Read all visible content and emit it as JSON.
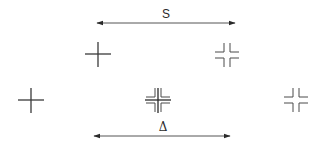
{
  "diagram": {
    "type": "shear-interferometry-pattern",
    "colors": {
      "stroke": "#3a3a3a",
      "background": "#ffffff"
    },
    "arrows": [
      {
        "id": "shift-s",
        "label": "S",
        "x1": 97,
        "x2": 235,
        "y": 23,
        "label_x": 166,
        "label_y": 14
      },
      {
        "id": "shift-delta",
        "label": "Δ",
        "x1": 94,
        "x2": 230,
        "y": 136,
        "label_x": 163,
        "label_y": 127
      }
    ],
    "markers": [
      {
        "id": "top-solid",
        "kind": "solid-cross",
        "cx": 98,
        "cy": 54
      },
      {
        "id": "top-split",
        "kind": "split-cross",
        "cx": 227,
        "cy": 55
      },
      {
        "id": "left-solid",
        "kind": "solid-cross",
        "cx": 31,
        "cy": 100
      },
      {
        "id": "center-overlap",
        "kind": "overlapped-cross",
        "cx": 158,
        "cy": 100
      },
      {
        "id": "right-split",
        "kind": "split-cross",
        "cx": 296,
        "cy": 100
      }
    ]
  }
}
